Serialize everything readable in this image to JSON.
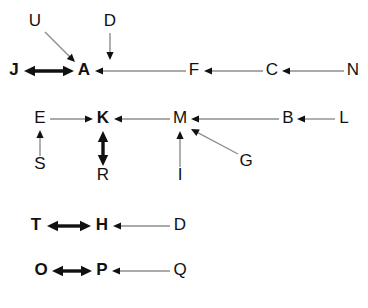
{
  "diagram": {
    "background_color": "#ffffff",
    "thin_edge_color": "#8e8e8e",
    "thick_edge_color": "#111111",
    "label_color": "#111111",
    "nodes": [
      {
        "id": "U",
        "label": "U",
        "x": 35,
        "y": 22,
        "weight": "plain"
      },
      {
        "id": "D1",
        "label": "D",
        "x": 110,
        "y": 22,
        "weight": "plain"
      },
      {
        "id": "J",
        "label": "J",
        "x": 14,
        "y": 71,
        "weight": "bold"
      },
      {
        "id": "A",
        "label": "A",
        "x": 84,
        "y": 71,
        "weight": "bold"
      },
      {
        "id": "F",
        "label": "F",
        "x": 194,
        "y": 71,
        "weight": "plain"
      },
      {
        "id": "C",
        "label": "C",
        "x": 272,
        "y": 71,
        "weight": "plain"
      },
      {
        "id": "N",
        "label": "N",
        "x": 353,
        "y": 71,
        "weight": "plain"
      },
      {
        "id": "E",
        "label": "E",
        "x": 40,
        "y": 119,
        "weight": "plain"
      },
      {
        "id": "K",
        "label": "K",
        "x": 103,
        "y": 119,
        "weight": "bold"
      },
      {
        "id": "M",
        "label": "M",
        "x": 180,
        "y": 119,
        "weight": "plain"
      },
      {
        "id": "B",
        "label": "B",
        "x": 288,
        "y": 119,
        "weight": "plain"
      },
      {
        "id": "L",
        "label": "L",
        "x": 344,
        "y": 119,
        "weight": "plain"
      },
      {
        "id": "S",
        "label": "S",
        "x": 40,
        "y": 165,
        "weight": "plain"
      },
      {
        "id": "R",
        "label": "R",
        "x": 103,
        "y": 176,
        "weight": "plain"
      },
      {
        "id": "I",
        "label": "I",
        "x": 180,
        "y": 176,
        "weight": "plain"
      },
      {
        "id": "G",
        "label": "G",
        "x": 246,
        "y": 162,
        "weight": "plain"
      },
      {
        "id": "T",
        "label": "T",
        "x": 36,
        "y": 226,
        "weight": "bold"
      },
      {
        "id": "H",
        "label": "H",
        "x": 102,
        "y": 226,
        "weight": "bold"
      },
      {
        "id": "D2",
        "label": "D",
        "x": 180,
        "y": 226,
        "weight": "plain"
      },
      {
        "id": "O",
        "label": "O",
        "x": 41,
        "y": 271,
        "weight": "bold"
      },
      {
        "id": "P",
        "label": "P",
        "x": 102,
        "y": 271,
        "weight": "bold"
      },
      {
        "id": "Q",
        "label": "Q",
        "x": 180,
        "y": 271,
        "weight": "plain"
      }
    ],
    "edges": [
      {
        "id": "U-A",
        "from": "U",
        "to": "A",
        "style": "thin",
        "direction": "single",
        "x1": 45,
        "y1": 32,
        "x2": 75,
        "y2": 62
      },
      {
        "id": "D1-A",
        "from": "D1",
        "to": "A",
        "style": "thin",
        "direction": "single",
        "x1": 110,
        "y1": 33,
        "x2": 110,
        "y2": 60
      },
      {
        "id": "J-A",
        "from": "J",
        "to": "A",
        "style": "thick",
        "direction": "double",
        "x1": 24,
        "y1": 71,
        "x2": 74,
        "y2": 71
      },
      {
        "id": "F-A",
        "from": "F",
        "to": "A",
        "style": "thin",
        "direction": "single",
        "x1": 186,
        "y1": 71,
        "x2": 95,
        "y2": 71
      },
      {
        "id": "C-F",
        "from": "C",
        "to": "F",
        "style": "thin",
        "direction": "single",
        "x1": 263,
        "y1": 71,
        "x2": 204,
        "y2": 71
      },
      {
        "id": "N-C",
        "from": "N",
        "to": "C",
        "style": "thin",
        "direction": "single",
        "x1": 344,
        "y1": 71,
        "x2": 282,
        "y2": 71
      },
      {
        "id": "E-K",
        "from": "E",
        "to": "K",
        "style": "thin",
        "direction": "single",
        "x1": 50,
        "y1": 119,
        "x2": 93,
        "y2": 119
      },
      {
        "id": "M-K",
        "from": "M",
        "to": "K",
        "style": "thin",
        "direction": "single",
        "x1": 170,
        "y1": 119,
        "x2": 114,
        "y2": 119
      },
      {
        "id": "B-M",
        "from": "B",
        "to": "M",
        "style": "thin",
        "direction": "single",
        "x1": 279,
        "y1": 119,
        "x2": 191,
        "y2": 119
      },
      {
        "id": "L-B",
        "from": "L",
        "to": "B",
        "style": "thin",
        "direction": "single",
        "x1": 335,
        "y1": 119,
        "x2": 297,
        "y2": 119
      },
      {
        "id": "S-E",
        "from": "S",
        "to": "E",
        "style": "thin",
        "direction": "single",
        "x1": 40,
        "y1": 156,
        "x2": 40,
        "y2": 130
      },
      {
        "id": "K-R",
        "from": "K",
        "to": "R",
        "style": "thick",
        "direction": "double",
        "x1": 103,
        "y1": 131,
        "x2": 103,
        "y2": 166
      },
      {
        "id": "I-M",
        "from": "I",
        "to": "M",
        "style": "thin",
        "direction": "single",
        "x1": 180,
        "y1": 167,
        "x2": 180,
        "y2": 131
      },
      {
        "id": "G-M",
        "from": "G",
        "to": "M",
        "style": "thin",
        "direction": "single",
        "x1": 238,
        "y1": 154,
        "x2": 191,
        "y2": 129
      },
      {
        "id": "T-H",
        "from": "T",
        "to": "H",
        "style": "thick",
        "direction": "double",
        "x1": 47,
        "y1": 226,
        "x2": 91,
        "y2": 226
      },
      {
        "id": "D2-H",
        "from": "D2",
        "to": "H",
        "style": "thin",
        "direction": "single",
        "x1": 170,
        "y1": 226,
        "x2": 113,
        "y2": 226
      },
      {
        "id": "O-P",
        "from": "O",
        "to": "P",
        "style": "thick",
        "direction": "double",
        "x1": 52,
        "y1": 271,
        "x2": 92,
        "y2": 271
      },
      {
        "id": "Q-P",
        "from": "Q",
        "to": "P",
        "style": "thin",
        "direction": "single",
        "x1": 170,
        "y1": 271,
        "x2": 112,
        "y2": 271
      }
    ]
  }
}
